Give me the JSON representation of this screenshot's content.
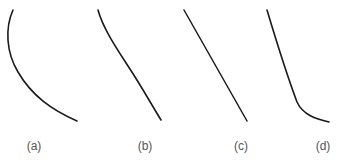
{
  "figure": {
    "stroke_color": "#1a1a1a",
    "panels": [
      {
        "id": "a",
        "label": "(a)",
        "shape": "concave curve bulging left, flattening toward lower right",
        "label_x": 34
      },
      {
        "id": "b",
        "label": "(b)",
        "shape": "slightly curved line descending to lower right",
        "label_x": 145
      },
      {
        "id": "c",
        "label": "(c)",
        "shape": "straight line descending to lower right",
        "label_x": 241
      },
      {
        "id": "d",
        "label": "(d)",
        "shape": "steep line bending to flat at lower right",
        "label_x": 323
      }
    ]
  }
}
